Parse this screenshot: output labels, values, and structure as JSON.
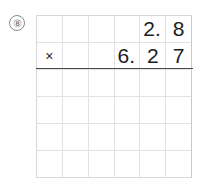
{
  "problem": {
    "number_label": "⑧",
    "number_plain": "8",
    "operator": "×",
    "multiplicand": "2.8",
    "multiplier": "6.27",
    "expression": "2.8 × 6.27"
  },
  "grid": {
    "columns": 6,
    "rows": 6,
    "line_color": "#e2e2e2",
    "rule_color": "#4a4a4a",
    "cells": [
      [
        {
          "text": "",
          "kind": "blank"
        },
        {
          "text": "",
          "kind": "blank"
        },
        {
          "text": "",
          "kind": "blank"
        },
        {
          "text": "",
          "kind": "blank"
        },
        {
          "text": "2.",
          "kind": "digit-point"
        },
        {
          "text": "8",
          "kind": "digit"
        }
      ],
      [
        {
          "text": "×",
          "kind": "operator"
        },
        {
          "text": "",
          "kind": "blank"
        },
        {
          "text": "",
          "kind": "blank"
        },
        {
          "text": "6.",
          "kind": "digit-point"
        },
        {
          "text": "2",
          "kind": "digit"
        },
        {
          "text": "7",
          "kind": "digit"
        }
      ],
      [
        {
          "text": "",
          "kind": "blank"
        },
        {
          "text": "",
          "kind": "blank"
        },
        {
          "text": "",
          "kind": "blank"
        },
        {
          "text": "",
          "kind": "blank"
        },
        {
          "text": "",
          "kind": "blank"
        },
        {
          "text": "",
          "kind": "blank"
        }
      ],
      [
        {
          "text": "",
          "kind": "blank"
        },
        {
          "text": "",
          "kind": "blank"
        },
        {
          "text": "",
          "kind": "blank"
        },
        {
          "text": "",
          "kind": "blank"
        },
        {
          "text": "",
          "kind": "blank"
        },
        {
          "text": "",
          "kind": "blank"
        }
      ],
      [
        {
          "text": "",
          "kind": "blank"
        },
        {
          "text": "",
          "kind": "blank"
        },
        {
          "text": "",
          "kind": "blank"
        },
        {
          "text": "",
          "kind": "blank"
        },
        {
          "text": "",
          "kind": "blank"
        },
        {
          "text": "",
          "kind": "blank"
        }
      ],
      [
        {
          "text": "",
          "kind": "blank"
        },
        {
          "text": "",
          "kind": "blank"
        },
        {
          "text": "",
          "kind": "blank"
        },
        {
          "text": "",
          "kind": "blank"
        },
        {
          "text": "",
          "kind": "blank"
        },
        {
          "text": "",
          "kind": "blank"
        }
      ]
    ]
  }
}
